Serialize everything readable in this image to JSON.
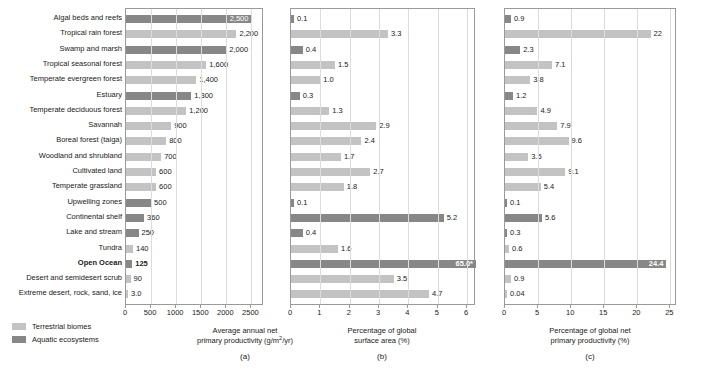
{
  "figure": {
    "panel_letters": [
      "(a)",
      "(b)",
      "(c)"
    ]
  },
  "legend": {
    "items": [
      {
        "label": "Terrestrial biomes",
        "swatch": "terrestrial",
        "color": "#c3c3c3"
      },
      {
        "label": "Aquatic ecosystems",
        "swatch": "aquatic",
        "color": "#878787"
      }
    ]
  },
  "categories": [
    "Algal beds and reefs",
    "Tropical rain forest",
    "Swamp and marsh",
    "Tropical seasonal forest",
    "Temperate evergreen forest",
    "Estuary",
    "Temperate deciduous forest",
    "Savannah",
    "Boreal forest (taiga)",
    "Woodland and shrubland",
    "Cultivated land",
    "Temperate grassland",
    "Upwelling zones",
    "Continental shelf",
    "Lake and stream",
    "Tundra",
    "Open Ocean",
    "Desert and semidesert scrub",
    "Extreme desert, rock, sand, ice"
  ],
  "category_types": [
    "aquatic",
    "terrestrial",
    "aquatic",
    "terrestrial",
    "terrestrial",
    "aquatic",
    "terrestrial",
    "terrestrial",
    "terrestrial",
    "terrestrial",
    "terrestrial",
    "terrestrial",
    "aquatic",
    "aquatic",
    "aquatic",
    "terrestrial",
    "aquatic",
    "terrestrial",
    "terrestrial"
  ],
  "emphasized_categories": [
    "Open Ocean"
  ],
  "chart_data": [
    {
      "type": "bar",
      "orientation": "horizontal",
      "panel": "(a)",
      "title": "",
      "xlabel": "Average annual net primary productivity (g/m2/yr)",
      "xlabel_line1": "Average annual net",
      "xlabel_line2_pre": "primary productivity (g/m",
      "xlabel_line2_sup": "2",
      "xlabel_line2_post": "/yr)",
      "ylabel": "",
      "xlim": [
        0,
        2750
      ],
      "xticks": [
        0,
        500,
        1000,
        1500,
        2000,
        2500
      ],
      "xticklabels": [
        "0",
        "500",
        "1000",
        "1500",
        "2000",
        "2500"
      ],
      "grid": true,
      "legend_position": "below-left",
      "categories": [
        "Algal beds and reefs",
        "Tropical rain forest",
        "Swamp and marsh",
        "Tropical seasonal forest",
        "Temperate evergreen forest",
        "Estuary",
        "Temperate deciduous forest",
        "Savannah",
        "Boreal forest (taiga)",
        "Woodland and shrubland",
        "Cultivated land",
        "Temperate grassland",
        "Upwelling zones",
        "Continental shelf",
        "Lake and stream",
        "Tundra",
        "Open Ocean",
        "Desert and semidesert scrub",
        "Extreme desert, rock, sand, ice"
      ],
      "values": [
        2500,
        2200,
        2000,
        1600,
        1400,
        1300,
        1200,
        900,
        800,
        700,
        600,
        600,
        500,
        360,
        250,
        140,
        125,
        90,
        3.0
      ],
      "value_labels": [
        "2,500",
        "2,200",
        "2,000",
        "1,600",
        "1,400",
        "1,300",
        "1,200",
        "900",
        "800",
        "700",
        "600",
        "600",
        "500",
        "360",
        "250",
        "140",
        "125",
        "90",
        "3.0"
      ],
      "label_inside": [
        true,
        false,
        false,
        false,
        false,
        false,
        false,
        false,
        false,
        false,
        false,
        false,
        false,
        false,
        false,
        false,
        false,
        false,
        false
      ]
    },
    {
      "type": "bar",
      "orientation": "horizontal",
      "panel": "(b)",
      "title": "",
      "xlabel": "Percentage of global surface area (%)",
      "xlabel_line1": "Percentage of global",
      "xlabel_line2": "surface area (%)",
      "ylabel": "",
      "xlim": [
        0,
        6.3
      ],
      "xticks": [
        0,
        1,
        2,
        3,
        4,
        5,
        6
      ],
      "xticklabels": [
        "0",
        "1",
        "2",
        "3",
        "4",
        "5",
        "6"
      ],
      "grid": true,
      "categories": [
        "Algal beds and reefs",
        "Tropical rain forest",
        "Swamp and marsh",
        "Tropical seasonal forest",
        "Temperate evergreen forest",
        "Estuary",
        "Temperate deciduous forest",
        "Savannah",
        "Boreal forest (taiga)",
        "Woodland and shrubland",
        "Cultivated land",
        "Temperate grassland",
        "Upwelling zones",
        "Continental shelf",
        "Lake and stream",
        "Tundra",
        "Open Ocean",
        "Desert and semidesert scrub",
        "Extreme desert, rock, sand, ice"
      ],
      "values": [
        0.1,
        3.3,
        0.4,
        1.5,
        1.0,
        0.3,
        1.3,
        2.9,
        2.4,
        1.7,
        2.7,
        1.8,
        0.1,
        5.2,
        0.4,
        1.6,
        6.3,
        3.5,
        4.7
      ],
      "value_labels": [
        "0.1",
        "3.3",
        "0.4",
        "1.5",
        "1.0",
        "0.3",
        "1.3",
        "2.9",
        "2.4",
        "1.7",
        "2.7",
        "1.8",
        "0.1",
        "5.2",
        "0.4",
        "1.6",
        "65.0*",
        "3.5",
        "4.7"
      ],
      "label_inside": [
        false,
        false,
        false,
        false,
        false,
        false,
        false,
        false,
        false,
        false,
        false,
        false,
        false,
        false,
        false,
        false,
        true,
        false,
        false
      ],
      "clipped_bars": [
        {
          "category": "Open Ocean",
          "true_value": 65.0,
          "note": "bar extends beyond axis; labeled 65.0*"
        }
      ],
      "footnote_marker": "*"
    },
    {
      "type": "bar",
      "orientation": "horizontal",
      "panel": "(c)",
      "title": "",
      "xlabel": "Percentage of global net primary productivity (%)",
      "xlabel_line1": "Percentage of global net",
      "xlabel_line2": "primary productivity (%)",
      "ylabel": "",
      "xlim": [
        0,
        26
      ],
      "xticks": [
        0,
        5,
        10,
        15,
        20,
        25
      ],
      "xticklabels": [
        "0",
        "5",
        "10",
        "15",
        "20",
        "25"
      ],
      "grid": true,
      "categories": [
        "Algal beds and reefs",
        "Tropical rain forest",
        "Swamp and marsh",
        "Tropical seasonal forest",
        "Temperate evergreen forest",
        "Estuary",
        "Temperate deciduous forest",
        "Savannah",
        "Boreal forest (taiga)",
        "Woodland and shrubland",
        "Cultivated land",
        "Temperate grassland",
        "Upwelling zones",
        "Continental shelf",
        "Lake and stream",
        "Tundra",
        "Open Ocean",
        "Desert and semidesert scrub",
        "Extreme desert, rock, sand, ice"
      ],
      "values": [
        0.9,
        22,
        2.3,
        7.1,
        3.8,
        1.2,
        4.9,
        7.9,
        9.6,
        3.5,
        9.1,
        5.4,
        0.1,
        5.6,
        0.3,
        0.6,
        24.4,
        0.9,
        0.04
      ],
      "value_labels": [
        "0.9",
        "22",
        "2.3",
        "7.1",
        "3.8",
        "1.2",
        "4.9",
        "7.9",
        "9.6",
        "3.5",
        "9.1",
        "5.4",
        "0.1",
        "5.6",
        "0.3",
        "0.6",
        "24.4",
        "0.9",
        "0.04"
      ],
      "label_inside": [
        false,
        false,
        false,
        false,
        false,
        false,
        false,
        false,
        false,
        false,
        false,
        false,
        false,
        false,
        false,
        false,
        true,
        false,
        false
      ]
    }
  ]
}
